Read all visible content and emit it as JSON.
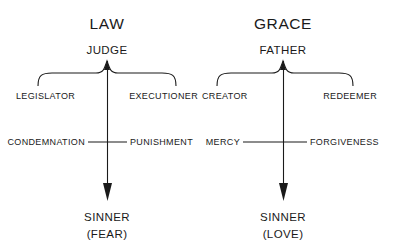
{
  "diagram": {
    "type": "two-column-concept-diagram",
    "background_color": "#ffffff",
    "ink_color": "#1a1a1a",
    "panels": [
      {
        "id": "law",
        "title": "LAW",
        "role": "JUDGE",
        "branch_left": "LEGISLATOR",
        "branch_right": "EXECUTIONER",
        "attribute_left": "CONDEMNATION",
        "attribute_right": "PUNISHMENT",
        "outcome": "SINNER",
        "outcome_qualifier": "(FEAR)"
      },
      {
        "id": "grace",
        "title": "GRACE",
        "role": "FATHER",
        "branch_left": "CREATOR",
        "branch_right": "REDEEMER",
        "attribute_left": "MERCY",
        "attribute_right": "FORGIVENESS",
        "outcome": "SINNER",
        "outcome_qualifier": "(LOVE)"
      }
    ]
  }
}
